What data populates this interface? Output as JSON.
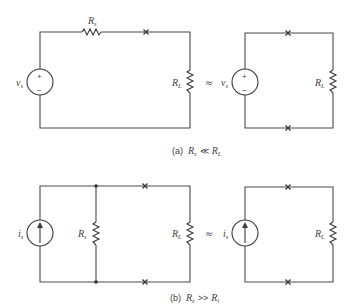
{
  "figure": {
    "panel_a": {
      "caption_prefix": "(a)",
      "caption_lhs": "R",
      "caption_lhs_sub": "s",
      "caption_rel": "≪",
      "caption_rhs": "R",
      "caption_rhs_sub": "L",
      "left_circuit": {
        "source_label": "v",
        "source_sub": "s",
        "source_plus": "+",
        "source_minus": "−",
        "series_resistor_label": "R",
        "series_resistor_sub": "s",
        "load_label": "R",
        "load_sub": "L"
      },
      "equivalence_symbol": "≈",
      "right_circuit": {
        "source_label": "v",
        "source_sub": "s",
        "source_plus": "+",
        "source_minus": "−",
        "load_label": "R",
        "load_sub": "L"
      }
    },
    "panel_b": {
      "caption_prefix": "(b)",
      "caption_lhs": "R",
      "caption_lhs_sub": "s",
      "caption_rel": ">>",
      "caption_rhs": "R",
      "caption_rhs_sub": "l",
      "left_circuit": {
        "source_label": "i",
        "source_sub": "s",
        "shunt_resistor_label": "R",
        "shunt_resistor_sub": "s",
        "load_label": "R",
        "load_sub": "L"
      },
      "equivalence_symbol": "≈",
      "right_circuit": {
        "source_label": "i",
        "source_sub": "s",
        "load_label": "R",
        "load_sub": "L"
      }
    }
  }
}
